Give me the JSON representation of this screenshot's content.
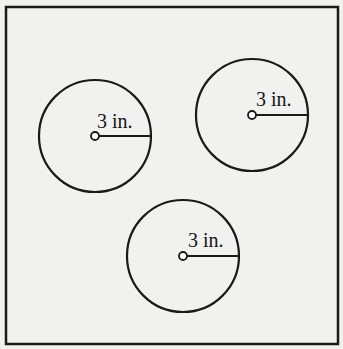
{
  "diagram": {
    "type": "geometry",
    "frame": {
      "x": 6,
      "y": 7,
      "width": 332,
      "height": 337,
      "stroke": "#1a1a1a"
    },
    "circles": [
      {
        "id": "circle-left",
        "cx": 95,
        "cy": 136,
        "r": 56,
        "radius_label": "3 in.",
        "label_x": 97,
        "label_y": 128
      },
      {
        "id": "circle-right",
        "cx": 252,
        "cy": 115,
        "r": 56,
        "radius_label": "3 in.",
        "label_x": 256,
        "label_y": 106
      },
      {
        "id": "circle-bottom",
        "cx": 183,
        "cy": 256,
        "r": 56,
        "radius_label": "3 in.",
        "label_x": 188,
        "label_y": 247
      }
    ],
    "colors": {
      "background": "#f1f1ef",
      "stroke": "#1a1a1a"
    }
  }
}
